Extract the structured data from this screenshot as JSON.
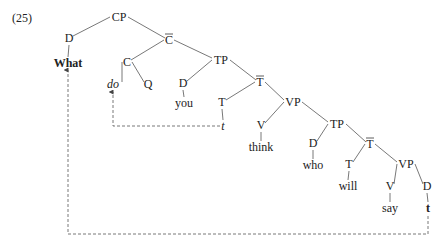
{
  "example_number": "(25)",
  "tree": {
    "nodes": [
      {
        "id": "CP",
        "label": "CP",
        "x": 119,
        "y": 21
      },
      {
        "id": "D1",
        "label": "D",
        "x": 69,
        "y": 42
      },
      {
        "id": "What",
        "label": "What",
        "x": 68,
        "y": 67,
        "style": "bold"
      },
      {
        "id": "Cbar",
        "label": "C",
        "bar": true,
        "x": 169,
        "y": 44
      },
      {
        "id": "C",
        "label": "C",
        "x": 127,
        "y": 66
      },
      {
        "id": "do",
        "label": "do",
        "x": 113,
        "y": 88,
        "style": "italic"
      },
      {
        "id": "Q",
        "label": "Q",
        "x": 148,
        "y": 88
      },
      {
        "id": "TP1",
        "label": "TP",
        "x": 221,
        "y": 64
      },
      {
        "id": "D2",
        "label": "D",
        "x": 183,
        "y": 87
      },
      {
        "id": "you",
        "label": "you",
        "x": 184,
        "y": 107
      },
      {
        "id": "Tbar1",
        "label": "T",
        "bar": true,
        "x": 260,
        "y": 86
      },
      {
        "id": "T1",
        "label": "T",
        "x": 222,
        "y": 106
      },
      {
        "id": "t1",
        "label": "t",
        "x": 223,
        "y": 130,
        "style": "italic"
      },
      {
        "id": "VP1",
        "label": "VP",
        "x": 293,
        "y": 106
      },
      {
        "id": "V1",
        "label": "V",
        "x": 261,
        "y": 129
      },
      {
        "id": "think",
        "label": "think",
        "x": 261,
        "y": 151
      },
      {
        "id": "TP2",
        "label": "TP",
        "x": 337,
        "y": 128
      },
      {
        "id": "D3",
        "label": "D",
        "x": 313,
        "y": 147
      },
      {
        "id": "who",
        "label": "who",
        "x": 313,
        "y": 169
      },
      {
        "id": "Tbar2",
        "label": "T",
        "bar": true,
        "x": 370,
        "y": 148
      },
      {
        "id": "T2",
        "label": "T",
        "x": 349,
        "y": 168
      },
      {
        "id": "will",
        "label": "will",
        "x": 348,
        "y": 190
      },
      {
        "id": "VP2",
        "label": "VP",
        "x": 406,
        "y": 168
      },
      {
        "id": "V2",
        "label": "V",
        "x": 390,
        "y": 190
      },
      {
        "id": "say",
        "label": "say",
        "x": 390,
        "y": 212
      },
      {
        "id": "D4",
        "label": "D",
        "x": 427,
        "y": 190
      },
      {
        "id": "t2",
        "label": "t",
        "x": 428,
        "y": 212,
        "style": "bold"
      }
    ],
    "edges": [
      [
        "CP",
        "D1"
      ],
      [
        "CP",
        "Cbar"
      ],
      [
        "D1",
        "What"
      ],
      [
        "Cbar",
        "C"
      ],
      [
        "Cbar",
        "TP1"
      ],
      [
        "C",
        "do"
      ],
      [
        "C",
        "Q"
      ],
      [
        "TP1",
        "D2"
      ],
      [
        "TP1",
        "Tbar1"
      ],
      [
        "D2",
        "you"
      ],
      [
        "Tbar1",
        "T1"
      ],
      [
        "Tbar1",
        "VP1"
      ],
      [
        "T1",
        "t1"
      ],
      [
        "VP1",
        "V1"
      ],
      [
        "VP1",
        "TP2"
      ],
      [
        "V1",
        "think"
      ],
      [
        "TP2",
        "D3"
      ],
      [
        "TP2",
        "Tbar2"
      ],
      [
        "D3",
        "who"
      ],
      [
        "Tbar2",
        "T2"
      ],
      [
        "Tbar2",
        "VP2"
      ],
      [
        "T2",
        "will"
      ],
      [
        "VP2",
        "V2"
      ],
      [
        "VP2",
        "D4"
      ],
      [
        "V2",
        "say"
      ],
      [
        "D4",
        "t2"
      ]
    ],
    "movement_arrows": [
      {
        "name": "t-to-do",
        "from": "t1",
        "to": "do",
        "points": [
          [
            220,
            126
          ],
          [
            113,
            126
          ],
          [
            113,
            92
          ]
        ]
      },
      {
        "name": "t-to-what",
        "from": "t2",
        "to": "What",
        "points": [
          [
            428,
            216
          ],
          [
            428,
            234
          ],
          [
            68,
            234
          ],
          [
            68,
            70
          ]
        ]
      }
    ]
  }
}
